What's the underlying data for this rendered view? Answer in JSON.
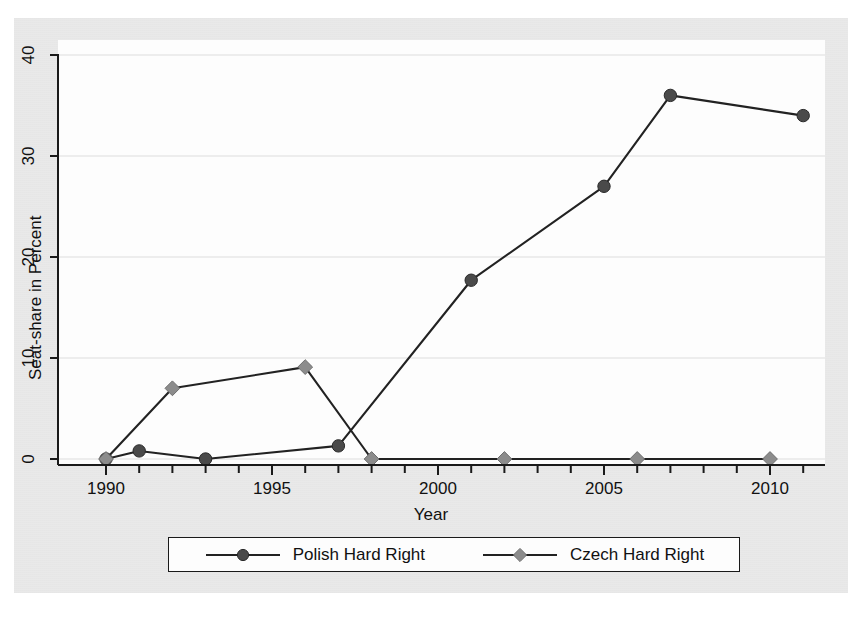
{
  "chart_data": {
    "type": "line",
    "title": "",
    "xlabel": "Year",
    "ylabel": "Seat-share in Percent",
    "xlim": [
      1990,
      2011.6
    ],
    "ylim": [
      0,
      40
    ],
    "xticks": [
      "1990",
      "1995",
      "2000",
      "2005",
      "2010"
    ],
    "xtick_values": [
      1990,
      1995,
      2000,
      2005,
      2010
    ],
    "minor_xticks_every": 1,
    "yticks": [
      "0",
      "10",
      "20",
      "30",
      "40"
    ],
    "ytick_values": [
      0,
      10,
      20,
      30,
      40
    ],
    "grid": "horizontal",
    "legend_position": "below-axes",
    "series": [
      {
        "name": "Polish Hard Right",
        "marker": "circle",
        "marker_color": "#4a4a4a",
        "line_color": "#222222",
        "x": [
          1990,
          1991,
          1993,
          1997,
          2001,
          2005,
          2007,
          2011
        ],
        "y": [
          0,
          0.8,
          0,
          1.3,
          17.7,
          27,
          36,
          34
        ]
      },
      {
        "name": "Czech Hard Right",
        "marker": "diamond",
        "marker_color": "#8c8c8c",
        "line_color": "#222222",
        "x": [
          1990,
          1992,
          1996,
          1998,
          2002,
          2006,
          2010
        ],
        "y": [
          0,
          7,
          9.1,
          0,
          0,
          0,
          0
        ]
      }
    ]
  },
  "legend": {
    "entries": [
      {
        "label": "Polish Hard Right",
        "marker": "circle-marker"
      },
      {
        "label": "Czech Hard Right",
        "marker": "diamond-marker"
      }
    ]
  },
  "colors": {
    "polish_marker": "#4a4a4a",
    "czech_marker": "#8c8c8c",
    "line": "#222222",
    "axis": "#1a1a1a",
    "grid": "#dddddd",
    "paper": "#e9e9e9",
    "panel": "#fdfdfd"
  }
}
